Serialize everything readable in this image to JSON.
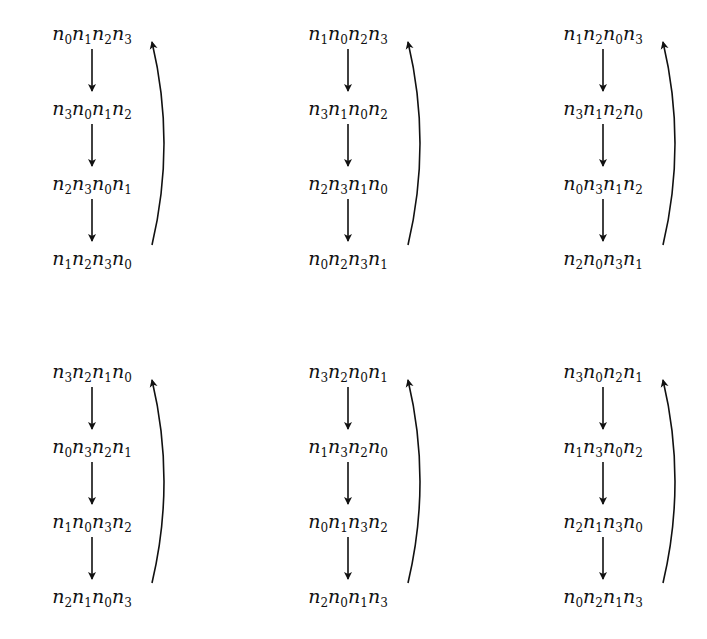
{
  "diagram": {
    "symbol": "n",
    "cycles": [
      {
        "id": "cycle-1",
        "row": 0,
        "col": 0,
        "terms": [
          [
            0,
            1,
            2,
            3
          ],
          [
            3,
            0,
            1,
            2
          ],
          [
            2,
            3,
            0,
            1
          ],
          [
            1,
            2,
            3,
            0
          ]
        ]
      },
      {
        "id": "cycle-2",
        "row": 0,
        "col": 1,
        "terms": [
          [
            1,
            0,
            2,
            3
          ],
          [
            3,
            1,
            0,
            2
          ],
          [
            2,
            3,
            1,
            0
          ],
          [
            0,
            2,
            3,
            1
          ]
        ]
      },
      {
        "id": "cycle-3",
        "row": 0,
        "col": 2,
        "terms": [
          [
            1,
            2,
            0,
            3
          ],
          [
            3,
            1,
            2,
            0
          ],
          [
            0,
            3,
            1,
            2
          ],
          [
            2,
            0,
            3,
            1
          ]
        ]
      },
      {
        "id": "cycle-4",
        "row": 1,
        "col": 0,
        "terms": [
          [
            3,
            2,
            1,
            0
          ],
          [
            0,
            3,
            2,
            1
          ],
          [
            1,
            0,
            3,
            2
          ],
          [
            2,
            1,
            0,
            3
          ]
        ]
      },
      {
        "id": "cycle-5",
        "row": 1,
        "col": 1,
        "terms": [
          [
            3,
            2,
            0,
            1
          ],
          [
            1,
            3,
            2,
            0
          ],
          [
            0,
            1,
            3,
            2
          ],
          [
            2,
            0,
            1,
            3
          ]
        ]
      },
      {
        "id": "cycle-6",
        "row": 1,
        "col": 2,
        "terms": [
          [
            3,
            0,
            2,
            1
          ],
          [
            1,
            3,
            0,
            2
          ],
          [
            2,
            1,
            3,
            0
          ],
          [
            0,
            2,
            1,
            3
          ]
        ]
      }
    ],
    "labels": {
      "cycle-1": [
        "n0n1n2n3",
        "n3n0n1n2",
        "n2n3n0n1",
        "n1n2n3n0"
      ],
      "cycle-2": [
        "n1n0n2n3",
        "n3n1n0n2",
        "n2n3n1n0",
        "n0n2n3n1"
      ],
      "cycle-3": [
        "n1n2n0n3",
        "n3n1n2n0",
        "n0n3n1n2",
        "n2n0n3n1"
      ],
      "cycle-4": [
        "n3n2n1n0",
        "n0n3n2n1",
        "n1n0n3n2",
        "n2n1n0n3"
      ],
      "cycle-5": [
        "n3n2n0n1",
        "n1n3n2n0",
        "n0n1n3n2",
        "n2n0n1n3"
      ],
      "cycle-6": [
        "n3n0n2n1",
        "n1n3n0n2",
        "n2n1n3n0",
        "n0n2n1n3"
      ]
    },
    "layout": {
      "col_left": [
        36,
        292,
        547
      ],
      "row_top": [
        22,
        360
      ],
      "term_spacing": 75
    }
  }
}
